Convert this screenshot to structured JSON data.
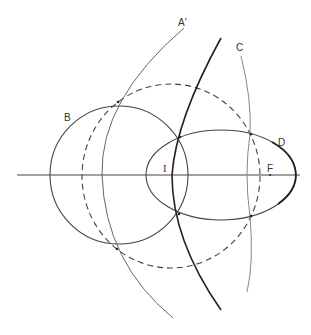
{
  "diagram": {
    "labels": {
      "a_prime": "A'",
      "b": "B",
      "c": "C",
      "d": "D",
      "i": "I",
      "f": "F"
    },
    "colors": {
      "line": "#333333",
      "thin_line": "#555555",
      "light_line": "#888888",
      "background": "#ffffff"
    }
  }
}
